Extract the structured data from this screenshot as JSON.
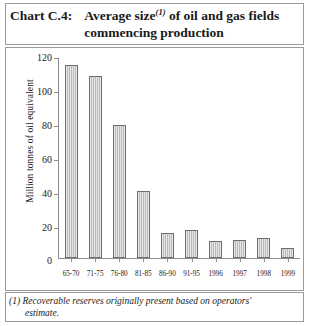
{
  "title": {
    "chart_label": "Chart C.4:",
    "main": "Average size",
    "footnote_marker": "(1)",
    "main_rest": " of oil and gas fields commencing production"
  },
  "footnote": {
    "line1": "(1) Recoverable reserves originally present based on operators'",
    "line2": "estimate."
  },
  "axis": {
    "y_title": "Million tonnes of oil equivalent",
    "y_ticks": [
      "120",
      "100",
      "80",
      "60",
      "40",
      "20",
      "0"
    ]
  },
  "colors": {
    "bar_fill": "#c9c9c9",
    "bar_border": "#6e6e6e",
    "frame": "#9a9a9a",
    "axis": "#8d8d8d",
    "text": "#1a1a1a"
  },
  "chart_data": {
    "type": "bar",
    "title": "Average size(1) of oil and gas fields commencing production",
    "xlabel": "",
    "ylabel": "Million tonnes of oil equivalent",
    "ylim": [
      0,
      120
    ],
    "ytick_step": 20,
    "grid": false,
    "legend": "none",
    "categories": [
      "65-70",
      "71-75",
      "76-80",
      "81-85",
      "86-90",
      "91-95",
      "1996",
      "1997",
      "1998",
      "1999"
    ],
    "values": [
      116,
      109,
      80,
      40,
      15,
      17,
      10,
      11,
      12,
      6
    ]
  }
}
